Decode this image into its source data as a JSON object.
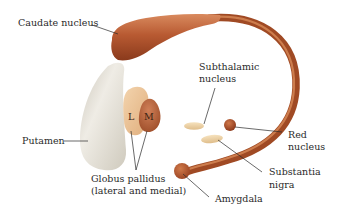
{
  "diagram": {
    "colors": {
      "caudate": "#b85a32",
      "caudate_highlight": "#d98a5e",
      "caudate_dark": "#8a3a1c",
      "putamen": "#d9d5cb",
      "putamen_highlight": "#efece5",
      "globus_lateral": "#edc498",
      "globus_medial": "#b9653c",
      "subthalamic": "#ecd2a6",
      "red_nucleus": "#a84a26",
      "leader_line": "#2a2a2a",
      "text": "#2a2a2a"
    },
    "labels": {
      "caudate_nucleus": "Caudate nucleus",
      "subthalamic_line1": "Subthalamic",
      "subthalamic_line2": "nucleus",
      "putamen": "Putamen",
      "globus_line1": "Globus pallidus",
      "globus_line2": "(lateral and medial)",
      "lateral_marker": "L",
      "medial_marker": "M",
      "red_line1": "Red",
      "red_line2": "nucleus",
      "substantia_line1": "Substantia",
      "substantia_line2": "nigra",
      "amygdala": "Amygdala"
    }
  }
}
